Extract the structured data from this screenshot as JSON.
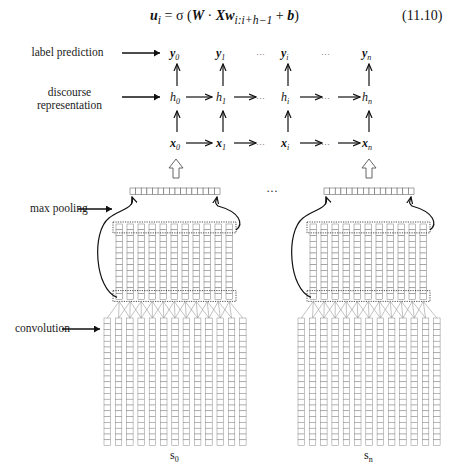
{
  "equation": {
    "lhs": "u",
    "lhs_sub": "i",
    "rhs_prefix": " = σ (",
    "W": "W",
    "dot": " · ",
    "X": "X",
    "w": "w",
    "w_sub": "i:i+h−1",
    "plus": " + ",
    "b": "b",
    "close": ")",
    "number": "(11.10)"
  },
  "labels": {
    "label_prediction": "label prediction",
    "discourse_line1": "discourse",
    "discourse_line2": "representation",
    "max_pooling": "max pooling",
    "convolution": "convolution",
    "ellipsis_between_sentences": "···"
  },
  "grid": {
    "y_row": [
      {
        "base": "y",
        "sub": "0"
      },
      {
        "base": "y",
        "sub": "1"
      },
      {
        "base": "···",
        "sub": ""
      },
      {
        "base": "y",
        "sub": "i"
      },
      {
        "base": "···",
        "sub": ""
      },
      {
        "base": "y",
        "sub": "n"
      }
    ],
    "h_row": [
      {
        "base": "h",
        "sub": "0"
      },
      {
        "base": "h",
        "sub": "1"
      },
      {
        "base": "···",
        "sub": ""
      },
      {
        "base": "h",
        "sub": "i"
      },
      {
        "base": "···",
        "sub": ""
      },
      {
        "base": "h",
        "sub": "n"
      }
    ],
    "x_row": [
      {
        "base": "x",
        "sub": "0"
      },
      {
        "base": "x",
        "sub": "1"
      },
      {
        "base": "···",
        "sub": ""
      },
      {
        "base": "x",
        "sub": "i"
      },
      {
        "base": "···",
        "sub": ""
      },
      {
        "base": "x",
        "sub": "n"
      }
    ]
  },
  "sentences": [
    {
      "label_base": "s",
      "label_sub": "0"
    },
    {
      "label_base": "s",
      "label_sub": "n"
    }
  ],
  "structure": {
    "pooling_cells": 16,
    "feature_map_columns": 11,
    "feature_map_rows": 9,
    "input_columns": 13,
    "input_rows": 14
  }
}
